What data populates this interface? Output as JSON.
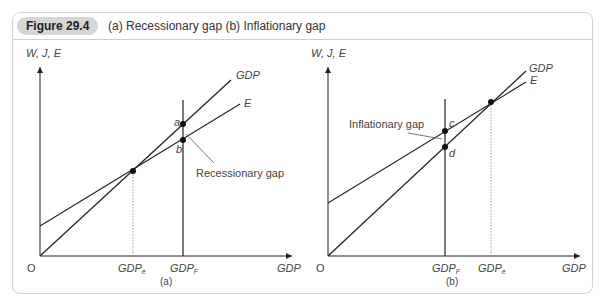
{
  "header": {
    "figure_label": "Figure 29.4",
    "title": "(a) Recessionary gap (b) Inflationary gap"
  },
  "panels": [
    {
      "id": "a",
      "caption": "(a)",
      "y_axis_label": "W, J, E",
      "x_axis_label": "GDP",
      "origin_label": "O",
      "lines": {
        "gdp": "GDP",
        "e": "E"
      },
      "x_ticks": [
        "GDPₑ",
        "GDPᶠ"
      ],
      "tick_main": [
        "GDP",
        "GDP"
      ],
      "tick_sub": [
        "e",
        "F"
      ],
      "points": [
        "a",
        "b"
      ],
      "gap_label": "Recessionary gap"
    },
    {
      "id": "b",
      "caption": "(b)",
      "y_axis_label": "W, J, E",
      "x_axis_label": "GDP",
      "origin_label": "O",
      "lines": {
        "gdp": "GDP",
        "e": "E"
      },
      "tick_main": [
        "GDP",
        "GDP"
      ],
      "tick_sub": [
        "F",
        "e"
      ],
      "points": [
        "c",
        "d"
      ],
      "gap_label": "Inflationary gap"
    }
  ],
  "colors": {
    "line": "#222222",
    "frame": "#d4d4d4",
    "pill": "#d6d6d6",
    "text": "#444444"
  }
}
